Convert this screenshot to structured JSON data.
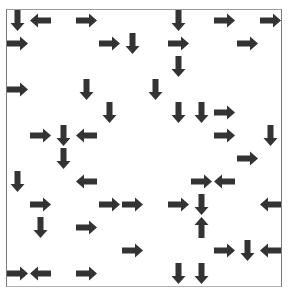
{
  "board": {
    "rows": 12,
    "cols": 12,
    "cell_size": 23,
    "arrow_color": "#333333",
    "arrows": [
      {
        "row": 0,
        "col": 0,
        "dir": "down"
      },
      {
        "row": 0,
        "col": 1,
        "dir": "left"
      },
      {
        "row": 0,
        "col": 3,
        "dir": "right"
      },
      {
        "row": 0,
        "col": 7,
        "dir": "down"
      },
      {
        "row": 0,
        "col": 9,
        "dir": "right"
      },
      {
        "row": 0,
        "col": 11,
        "dir": "right"
      },
      {
        "row": 1,
        "col": 0,
        "dir": "right"
      },
      {
        "row": 1,
        "col": 4,
        "dir": "right"
      },
      {
        "row": 1,
        "col": 5,
        "dir": "down"
      },
      {
        "row": 1,
        "col": 7,
        "dir": "right"
      },
      {
        "row": 1,
        "col": 10,
        "dir": "right"
      },
      {
        "row": 2,
        "col": 7,
        "dir": "down"
      },
      {
        "row": 3,
        "col": 0,
        "dir": "right"
      },
      {
        "row": 3,
        "col": 3,
        "dir": "down"
      },
      {
        "row": 3,
        "col": 6,
        "dir": "down"
      },
      {
        "row": 4,
        "col": 4,
        "dir": "down"
      },
      {
        "row": 4,
        "col": 7,
        "dir": "down"
      },
      {
        "row": 4,
        "col": 8,
        "dir": "down"
      },
      {
        "row": 4,
        "col": 9,
        "dir": "right"
      },
      {
        "row": 5,
        "col": 1,
        "dir": "right"
      },
      {
        "row": 5,
        "col": 2,
        "dir": "down"
      },
      {
        "row": 5,
        "col": 3,
        "dir": "left"
      },
      {
        "row": 5,
        "col": 9,
        "dir": "right"
      },
      {
        "row": 5,
        "col": 11,
        "dir": "down"
      },
      {
        "row": 6,
        "col": 2,
        "dir": "down"
      },
      {
        "row": 6,
        "col": 10,
        "dir": "right"
      },
      {
        "row": 7,
        "col": 0,
        "dir": "down"
      },
      {
        "row": 7,
        "col": 3,
        "dir": "left"
      },
      {
        "row": 7,
        "col": 8,
        "dir": "right"
      },
      {
        "row": 7,
        "col": 9,
        "dir": "left"
      },
      {
        "row": 8,
        "col": 1,
        "dir": "right"
      },
      {
        "row": 8,
        "col": 4,
        "dir": "right"
      },
      {
        "row": 8,
        "col": 5,
        "dir": "right"
      },
      {
        "row": 8,
        "col": 7,
        "dir": "right"
      },
      {
        "row": 8,
        "col": 8,
        "dir": "down"
      },
      {
        "row": 8,
        "col": 11,
        "dir": "left"
      },
      {
        "row": 9,
        "col": 1,
        "dir": "down"
      },
      {
        "row": 9,
        "col": 3,
        "dir": "right"
      },
      {
        "row": 9,
        "col": 8,
        "dir": "up"
      },
      {
        "row": 10,
        "col": 5,
        "dir": "right"
      },
      {
        "row": 10,
        "col": 9,
        "dir": "right"
      },
      {
        "row": 10,
        "col": 10,
        "dir": "down"
      },
      {
        "row": 10,
        "col": 11,
        "dir": "left"
      },
      {
        "row": 11,
        "col": 0,
        "dir": "right"
      },
      {
        "row": 11,
        "col": 1,
        "dir": "left"
      },
      {
        "row": 11,
        "col": 3,
        "dir": "right"
      },
      {
        "row": 11,
        "col": 7,
        "dir": "down"
      },
      {
        "row": 11,
        "col": 8,
        "dir": "down"
      }
    ]
  }
}
